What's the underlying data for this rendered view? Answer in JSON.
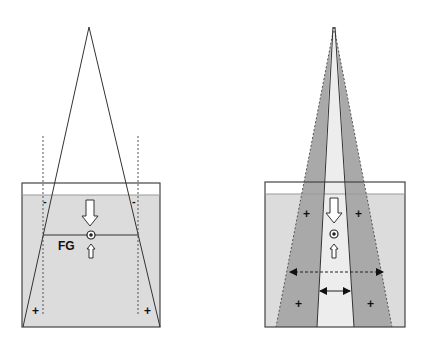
{
  "left_panel": {
    "label_fg": "FG",
    "minus_left": "-",
    "minus_right": "-",
    "plus_left": "+",
    "plus_right": "+"
  },
  "right_panel": {
    "plus_top_left": "+",
    "plus_top_right": "+",
    "plus_bottom_left": "+",
    "plus_bottom_right": "+"
  },
  "colors": {
    "water": "#dcdcdc",
    "wedge": "#a9a9a9",
    "center_band": "#ededed",
    "stroke": "#333333"
  }
}
